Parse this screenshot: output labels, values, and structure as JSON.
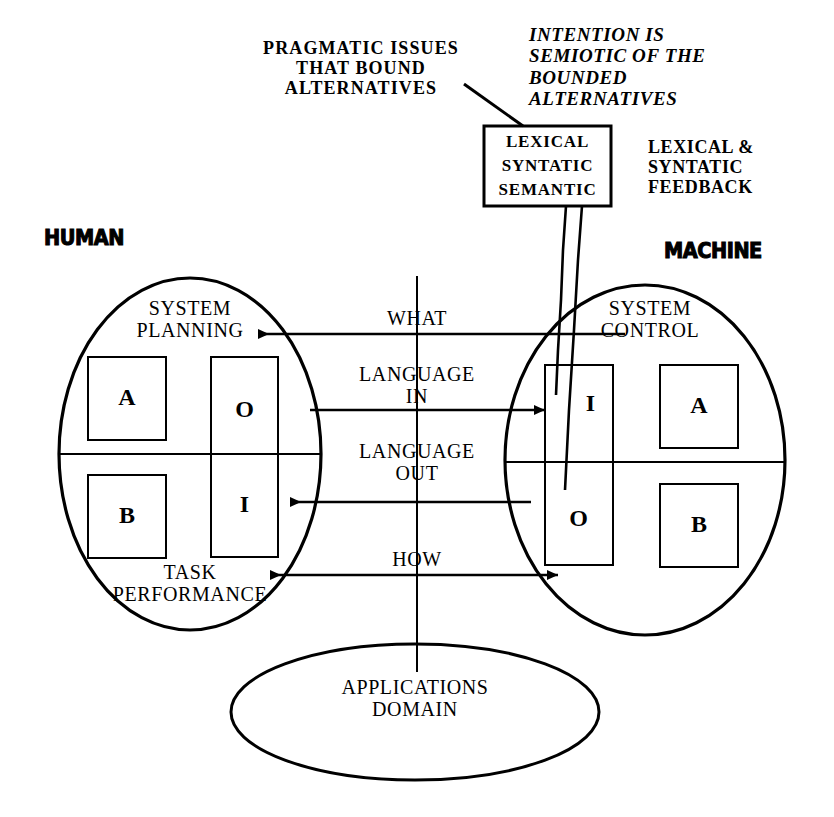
{
  "diagram": {
    "title_annotations": {
      "pragmatic": "PRAGMATIC ISSUES\nTHAT BOUND\nALTERNATIVES",
      "intention": "INTENTION IS\nSEMIOTIC OF THE\nBOUNDED\nALTERNATIVES",
      "feedback": "LEXICAL &\nSYNTATIC\nFEEDBACK"
    },
    "lexical_box": {
      "line1": "LEXICAL",
      "line2": "SYNTATIC",
      "line3": "SEMANTIC"
    },
    "side_labels": {
      "human": "HUMAN",
      "machine": "MACHINE"
    },
    "human_ellipse": {
      "top_label": "SYSTEM\nPLANNING",
      "bottom_label": "TASK\nPERFORMANCE",
      "boxes": [
        {
          "name": "human-box-a",
          "letter": "A"
        },
        {
          "name": "human-box-b",
          "letter": "B"
        },
        {
          "name": "human-box-o",
          "letter": "O"
        },
        {
          "name": "human-box-i",
          "letter": "I"
        }
      ]
    },
    "machine_ellipse": {
      "top_label": "SYSTEM\nCONTROL",
      "boxes": [
        {
          "name": "machine-box-i",
          "letter": "I"
        },
        {
          "name": "machine-box-o",
          "letter": "O"
        },
        {
          "name": "machine-box-a",
          "letter": "A"
        },
        {
          "name": "machine-box-b",
          "letter": "B"
        }
      ]
    },
    "applications_ellipse": {
      "label": "APPLICATIONS\nDOMAIN"
    },
    "channel_labels": {
      "what": "WHAT",
      "language_in": "LANGUAGE\nIN",
      "language_out": "LANGUAGE\nOUT",
      "how": "HOW"
    },
    "colors": {
      "stroke": "#000000",
      "background": "#ffffff",
      "text": "#000000"
    }
  }
}
